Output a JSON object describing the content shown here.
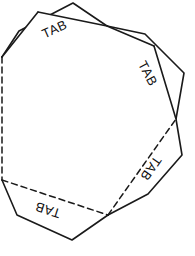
{
  "figure": {
    "background_color": "#ffffff",
    "stroke_color": "#1a1a1a",
    "fill_color": "#ffffff",
    "solid_stroke_width": 1.6,
    "dashed_stroke_width": 1.5,
    "dash_pattern": "6 4"
  },
  "shape": {
    "name": "octagon-body",
    "sides": 8,
    "fold_lines": 8,
    "vertices": [
      {
        "x": 2,
        "y": 57
      },
      {
        "x": 2,
        "y": 180
      },
      {
        "x": 108,
        "y": 215
      },
      {
        "x": 176,
        "y": 119
      },
      {
        "x": 154,
        "y": 46
      },
      {
        "x": 107,
        "y": 26
      },
      {
        "x": 38,
        "y": 12
      },
      {
        "x": 2,
        "y": 57
      }
    ]
  },
  "tabs": [
    {
      "id": "tab-top-left",
      "label": "TAB",
      "label_x": 55,
      "label_y": 30,
      "label_rotation": -24,
      "attached_edge": [
        {
          "x": 2,
          "y": 57
        },
        {
          "x": 107,
          "y": 26
        }
      ],
      "outline": [
        {
          "x": 2,
          "y": 57
        },
        {
          "x": 19,
          "y": 31
        },
        {
          "x": 73,
          "y": 3
        },
        {
          "x": 107,
          "y": 26
        }
      ]
    },
    {
      "id": "tab-upper-right",
      "label": "TAB",
      "label_x": 147,
      "label_y": 74,
      "label_rotation": 62,
      "attached_edge": [
        {
          "x": 107,
          "y": 26
        },
        {
          "x": 176,
          "y": 119
        }
      ],
      "outline": [
        {
          "x": 107,
          "y": 26
        },
        {
          "x": 145,
          "y": 34
        },
        {
          "x": 184,
          "y": 73
        },
        {
          "x": 176,
          "y": 119
        }
      ]
    },
    {
      "id": "tab-lower-right",
      "label": "TAB",
      "label_x": 150,
      "label_y": 168,
      "label_rotation": 125,
      "attached_edge": [
        {
          "x": 176,
          "y": 119
        },
        {
          "x": 108,
          "y": 215
        }
      ],
      "outline": [
        {
          "x": 176,
          "y": 119
        },
        {
          "x": 182,
          "y": 155
        },
        {
          "x": 148,
          "y": 194
        },
        {
          "x": 108,
          "y": 215
        }
      ]
    },
    {
      "id": "tab-bottom-left",
      "label": "TAB",
      "label_x": 48,
      "label_y": 209,
      "label_rotation": 198,
      "attached_edge": [
        {
          "x": 2,
          "y": 180
        },
        {
          "x": 108,
          "y": 215
        }
      ],
      "outline": [
        {
          "x": 2,
          "y": 180
        },
        {
          "x": 17,
          "y": 215
        },
        {
          "x": 72,
          "y": 240
        },
        {
          "x": 108,
          "y": 215
        }
      ]
    }
  ]
}
